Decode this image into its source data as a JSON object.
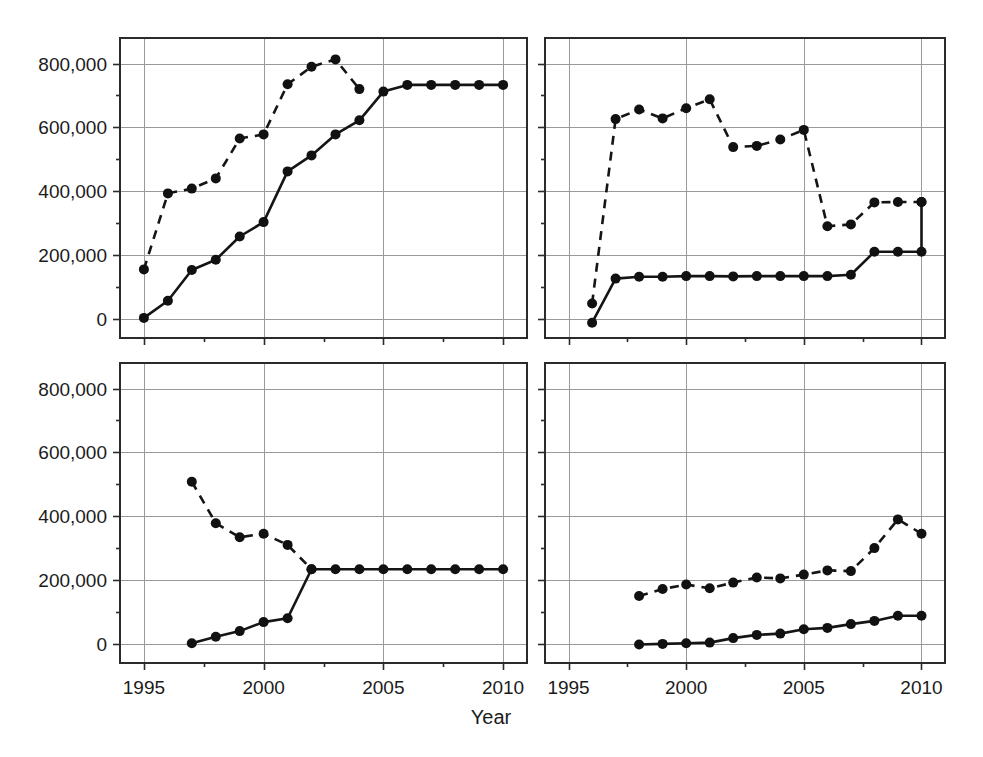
{
  "figure": {
    "xlabel": "Year",
    "panel_count": 4,
    "marker": "filled-circle",
    "line_color": "#151515",
    "grid_color": "#9a9a9a",
    "frame_color": "#2b2b2b",
    "background": "#ffffff"
  },
  "axes": {
    "y_ticks": [
      0,
      200000,
      400000,
      600000,
      800000
    ],
    "y_tick_labels": [
      "0",
      "200,000",
      "400,000",
      "600,000",
      "800,000"
    ],
    "y_minor_count": 1,
    "ylim": [
      -60000,
      880000
    ],
    "x_ticks": [
      1995,
      2000,
      2005,
      2010
    ],
    "x_tick_labels": [
      "1995",
      "2000",
      "2005",
      "2010"
    ],
    "xlim": [
      1994,
      2011
    ],
    "grid": "both"
  },
  "chart_data": [
    {
      "type": "line",
      "panel": "top-left",
      "title": "",
      "xlabel": "",
      "ylabel": "",
      "xlim": [
        1994,
        2011
      ],
      "ylim": [
        -60000,
        880000
      ],
      "grid": true,
      "legend": "none",
      "series": [
        {
          "name": "dashed",
          "style": "dashed",
          "x": [
            1995,
            1996,
            1997,
            1998,
            1999,
            2000,
            2001,
            2002,
            2003,
            2004
          ],
          "values": [
            155000,
            393000,
            408000,
            440000,
            565000,
            578000,
            735000,
            790000,
            813000,
            720000
          ]
        },
        {
          "name": "solid",
          "style": "solid",
          "x": [
            1995,
            1996,
            1997,
            1998,
            1999,
            2000,
            2001,
            2002,
            2003,
            2004,
            2005,
            2006,
            2007,
            2008,
            2009,
            2010
          ],
          "values": [
            3000,
            57000,
            153000,
            185000,
            258000,
            303000,
            462000,
            512000,
            578000,
            622000,
            712000,
            733000,
            733000,
            733000,
            733000,
            733000
          ]
        }
      ]
    },
    {
      "type": "line",
      "panel": "top-right",
      "title": "",
      "xlabel": "",
      "ylabel": "",
      "xlim": [
        1994,
        2011
      ],
      "ylim": [
        -60000,
        880000
      ],
      "grid": true,
      "legend": "none",
      "series": [
        {
          "name": "dashed",
          "style": "dashed",
          "x": [
            1996,
            1997,
            1998,
            1999,
            2000,
            2001,
            2002,
            2003,
            2004,
            2005,
            2006,
            2007,
            2008,
            2009,
            2010
          ],
          "values": [
            48000,
            626000,
            656000,
            628000,
            660000,
            688000,
            538000,
            542000,
            562000,
            592000,
            290000,
            296000,
            365000,
            366000,
            366000
          ]
        },
        {
          "name": "solid",
          "style": "solid",
          "x": [
            1996,
            1997,
            1998,
            1999,
            2000,
            2001,
            2002,
            2003,
            2004,
            2005,
            2006,
            2007,
            2008,
            2009,
            2010,
            2010
          ],
          "values": [
            -12000,
            126000,
            132000,
            132000,
            134000,
            134000,
            133000,
            134000,
            134000,
            134000,
            134000,
            138000,
            210000,
            210000,
            210000,
            366000
          ]
        }
      ]
    },
    {
      "type": "line",
      "panel": "bottom-left",
      "title": "",
      "xlabel": "",
      "ylabel": "",
      "xlim": [
        1994,
        2011
      ],
      "ylim": [
        -60000,
        880000
      ],
      "grid": true,
      "legend": "none",
      "series": [
        {
          "name": "dashed",
          "style": "dashed",
          "x": [
            1997,
            1998,
            1999,
            2000,
            2001,
            2002
          ],
          "values": [
            508000,
            378000,
            334000,
            345000,
            310000,
            234000
          ]
        },
        {
          "name": "solid",
          "style": "solid",
          "x": [
            1997,
            1998,
            1999,
            2000,
            2001,
            2002,
            2003,
            2004,
            2005,
            2006,
            2007,
            2008,
            2009,
            2010
          ],
          "values": [
            2000,
            22000,
            40000,
            68000,
            80000,
            234000,
            234000,
            234000,
            234000,
            234000,
            234000,
            234000,
            234000,
            234000
          ]
        }
      ]
    },
    {
      "type": "line",
      "panel": "bottom-right",
      "title": "",
      "xlabel": "",
      "ylabel": "",
      "xlim": [
        1994,
        2011
      ],
      "ylim": [
        -60000,
        880000
      ],
      "grid": true,
      "legend": "none",
      "series": [
        {
          "name": "dashed",
          "style": "dashed",
          "x": [
            1998,
            1999,
            2000,
            2001,
            2002,
            2003,
            2004,
            2005,
            2006,
            2007,
            2008,
            2009,
            2010
          ],
          "values": [
            150000,
            172000,
            186000,
            174000,
            192000,
            208000,
            205000,
            217000,
            230000,
            228000,
            300000,
            390000,
            345000
          ]
        },
        {
          "name": "solid",
          "style": "solid",
          "x": [
            1998,
            1999,
            2000,
            2001,
            2002,
            2003,
            2004,
            2005,
            2006,
            2007,
            2008,
            2009,
            2010
          ],
          "values": [
            -2000,
            0,
            2000,
            4000,
            18000,
            28000,
            32000,
            46000,
            50000,
            62000,
            72000,
            88000,
            88000
          ]
        }
      ]
    }
  ]
}
